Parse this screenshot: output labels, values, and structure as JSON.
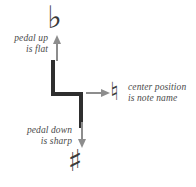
{
  "diagram": {
    "labels": {
      "pedal_up": "pedal up\nis flat",
      "pedal_down": "pedal down\nis sharp",
      "center_position": "center position\nis note name"
    },
    "glyphs": {
      "flat": "♭",
      "natural": "♮",
      "sharp": "♯"
    },
    "colors": {
      "symbol": "#2e2e2e",
      "arrow": "#8d8d8d",
      "text": "#4a4a4a",
      "background": "#ffffff"
    },
    "arrows": [
      {
        "name": "up",
        "direction": "up",
        "points_to": "flat"
      },
      {
        "name": "down",
        "direction": "down",
        "points_to": "sharp"
      },
      {
        "name": "right",
        "direction": "right",
        "points_to": "natural"
      }
    ]
  }
}
